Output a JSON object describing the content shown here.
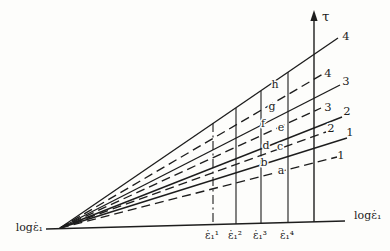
{
  "diagram": {
    "canvas": {
      "width": 390,
      "height": 251,
      "background": "#fdfdfb",
      "ink": "#1d1d1d"
    },
    "origin": {
      "x": 60,
      "y": 228
    },
    "x_axis": {
      "x1": 46,
      "y1": 229,
      "x2": 345,
      "y2": 221,
      "label_left": "logε̇₁",
      "label_left_x": 43,
      "label_left_y": 231,
      "label_right": "logε̇₁",
      "label_right_x": 354,
      "label_right_y": 219
    },
    "tau_axis": {
      "x": 314,
      "y_top": 20,
      "y_bottom": 222,
      "label": "τ",
      "label_x": 322,
      "label_y": 21
    },
    "fan_lines": [
      {
        "id": "solid-line-4",
        "style": "solid",
        "x2": 338,
        "y2": 38,
        "label": "4",
        "label_x": 346,
        "label_y": 40
      },
      {
        "id": "dashed-line-4",
        "style": "dashed",
        "x2": 323,
        "y2": 74,
        "label": "4",
        "label_x": 328,
        "label_y": 77
      },
      {
        "id": "solid-line-3",
        "style": "solid",
        "x2": 340,
        "y2": 85,
        "label": "3",
        "label_x": 346,
        "label_y": 85
      },
      {
        "id": "dashed-line-3",
        "style": "dashed",
        "x2": 321,
        "y2": 108,
        "label": "3",
        "label_x": 328,
        "label_y": 111
      },
      {
        "id": "solid-line-2",
        "style": "solid",
        "x2": 342,
        "y2": 117,
        "label": "2",
        "label_x": 347,
        "label_y": 115
      },
      {
        "id": "dashed-line-2",
        "style": "dashed",
        "x2": 326,
        "y2": 132,
        "label": "2",
        "label_x": 331,
        "label_y": 132
      },
      {
        "id": "solid-line-1",
        "style": "solid",
        "x2": 347,
        "y2": 138,
        "label": "1",
        "label_x": 350,
        "label_y": 136
      },
      {
        "id": "dashed-line-1",
        "style": "dashed",
        "x2": 337,
        "y2": 157,
        "label": "1",
        "label_x": 341,
        "label_y": 159
      }
    ],
    "strain_rate_lines": [
      {
        "id": "strain-rate-line-1",
        "x": 213,
        "y_top": 123,
        "y_bottom": 224.5,
        "style": "dashdot",
        "label": "ε̇₁¹",
        "label_x": 212,
        "label_y": 239
      },
      {
        "id": "strain-rate-line-2",
        "x": 236,
        "y_top": 108,
        "y_bottom": 224,
        "style": "solid",
        "label": "ε̇₁²",
        "label_x": 235,
        "label_y": 239
      },
      {
        "id": "strain-rate-line-3",
        "x": 261,
        "y_top": 91,
        "y_bottom": 223.2,
        "style": "solid",
        "label": "ε̇₁³",
        "label_x": 260,
        "label_y": 239
      },
      {
        "id": "strain-rate-line-4",
        "x": 288,
        "y_top": 72,
        "y_bottom": 222.5,
        "style": "solid",
        "label": "ε̇₁⁴",
        "label_x": 287,
        "label_y": 239
      }
    ],
    "point_labels": [
      {
        "text": "h",
        "x": 275,
        "y": 88
      },
      {
        "text": "g",
        "x": 272,
        "y": 110
      },
      {
        "text": "f",
        "x": 263,
        "y": 127
      },
      {
        "text": "e",
        "x": 281,
        "y": 131
      },
      {
        "text": "d",
        "x": 266,
        "y": 149
      },
      {
        "text": "c",
        "x": 280,
        "y": 150
      },
      {
        "text": "b",
        "x": 264,
        "y": 166
      },
      {
        "text": "a",
        "x": 281,
        "y": 174
      }
    ]
  }
}
